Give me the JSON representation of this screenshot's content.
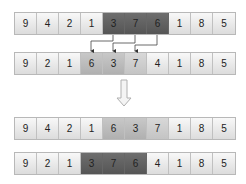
{
  "rows": [
    {
      "values": [
        "9",
        "4",
        "2",
        "1",
        "3",
        "7",
        "6",
        "1",
        "8",
        "5"
      ],
      "shading": [
        "",
        "",
        "",
        "",
        "dark",
        "dark",
        "dark",
        "",
        "",
        ""
      ]
    },
    {
      "values": [
        "9",
        "2",
        "1",
        "6",
        "3",
        "7",
        "4",
        "1",
        "8",
        "5"
      ],
      "shading": [
        "",
        "",
        "",
        "mid",
        "mid",
        "light",
        "",
        "",
        "",
        ""
      ]
    },
    {
      "values": [
        "9",
        "4",
        "2",
        "1",
        "6",
        "3",
        "7",
        "1",
        "8",
        "5"
      ],
      "shading": [
        "",
        "",
        "",
        "",
        "mid",
        "mid",
        "light",
        "",
        "",
        ""
      ]
    },
    {
      "values": [
        "9",
        "2",
        "1",
        "3",
        "7",
        "6",
        "4",
        "1",
        "8",
        "5"
      ],
      "shading": [
        "",
        "",
        "",
        "dark",
        "dark",
        "dark",
        "",
        "",
        "",
        ""
      ]
    }
  ],
  "colors": {
    "dark": "#5e5e5e",
    "mid": "#bcbcbc",
    "light": "#cecece",
    "cell": "#ececec",
    "arrow": "#333333"
  }
}
